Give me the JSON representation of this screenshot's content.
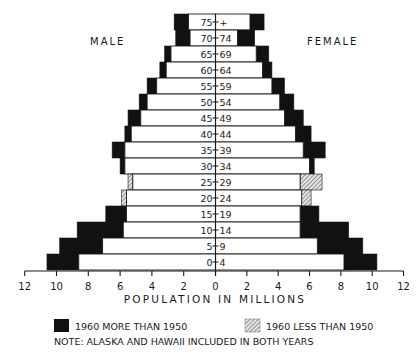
{
  "chart_data": {
    "type": "bar",
    "subtype": "population-pyramid",
    "title": "",
    "xlabel": "POPULATION IN MILLIONS",
    "ylabel": "",
    "xlim": [
      -12,
      12
    ],
    "xticks": [
      12,
      10,
      8,
      6,
      4,
      2,
      0,
      2,
      4,
      6,
      8,
      10,
      12
    ],
    "grid": false,
    "left_side_label": "MALE",
    "right_side_label": "FEMALE",
    "categories": [
      "75 + +",
      "70 - 74",
      "65 - 69",
      "60 - 64",
      "55 - 59",
      "50 - 54",
      "45 - 49",
      "40 - 44",
      "35 - 39",
      "30 - 34",
      "25 - 29",
      "20 - 24",
      "15 - 19",
      "10 - 14",
      "5 - 9",
      "0 - 4"
    ],
    "category_labels": [
      [
        "75",
        "+"
      ],
      [
        "70",
        "74"
      ],
      [
        "65",
        "69"
      ],
      [
        "60",
        "64"
      ],
      [
        "55",
        "59"
      ],
      [
        "50",
        "54"
      ],
      [
        "45",
        "49"
      ],
      [
        "40",
        "44"
      ],
      [
        "35",
        "39"
      ],
      [
        "30",
        "34"
      ],
      [
        "25",
        "29"
      ],
      [
        "20",
        "24"
      ],
      [
        "15",
        "19"
      ],
      [
        "10",
        "14"
      ],
      [
        "5",
        "9"
      ],
      [
        "0",
        "4"
      ]
    ],
    "series": [
      {
        "name": "Male 1950",
        "values": [
          1.7,
          1.6,
          2.8,
          3.1,
          3.7,
          4.3,
          4.7,
          5.3,
          5.7,
          5.7,
          5.5,
          5.9,
          5.6,
          5.8,
          7.1,
          8.6
        ]
      },
      {
        "name": "Male 1960",
        "values": [
          2.6,
          2.5,
          3.2,
          3.5,
          4.3,
          4.8,
          5.5,
          5.7,
          6.5,
          6.0,
          5.2,
          5.6,
          6.9,
          8.7,
          9.8,
          10.6
        ]
      },
      {
        "name": "Female 1950",
        "values": [
          2.2,
          1.4,
          2.6,
          3.0,
          3.6,
          4.1,
          4.4,
          5.1,
          5.6,
          6.0,
          6.8,
          6.1,
          5.4,
          5.4,
          6.5,
          8.2
        ]
      },
      {
        "name": "Female 1960",
        "values": [
          3.1,
          2.5,
          3.4,
          3.6,
          4.4,
          5.0,
          5.6,
          6.1,
          7.0,
          6.3,
          5.4,
          5.5,
          6.6,
          8.5,
          9.4,
          10.3
        ]
      }
    ],
    "legend": [
      {
        "label": "1960 MORE THAN 1950",
        "style": "solid-black"
      },
      {
        "label": "1960 LESS THAN 1950",
        "style": "hatched"
      }
    ],
    "legend_position": "bottom",
    "note": "NOTE: ALASKA AND HAWAII INCLUDED IN BOTH YEARS"
  },
  "colors": {
    "increase": "#111111",
    "decrease_hatch": "#555555",
    "base": "#ffffff",
    "ink": "#1a1a1a"
  }
}
